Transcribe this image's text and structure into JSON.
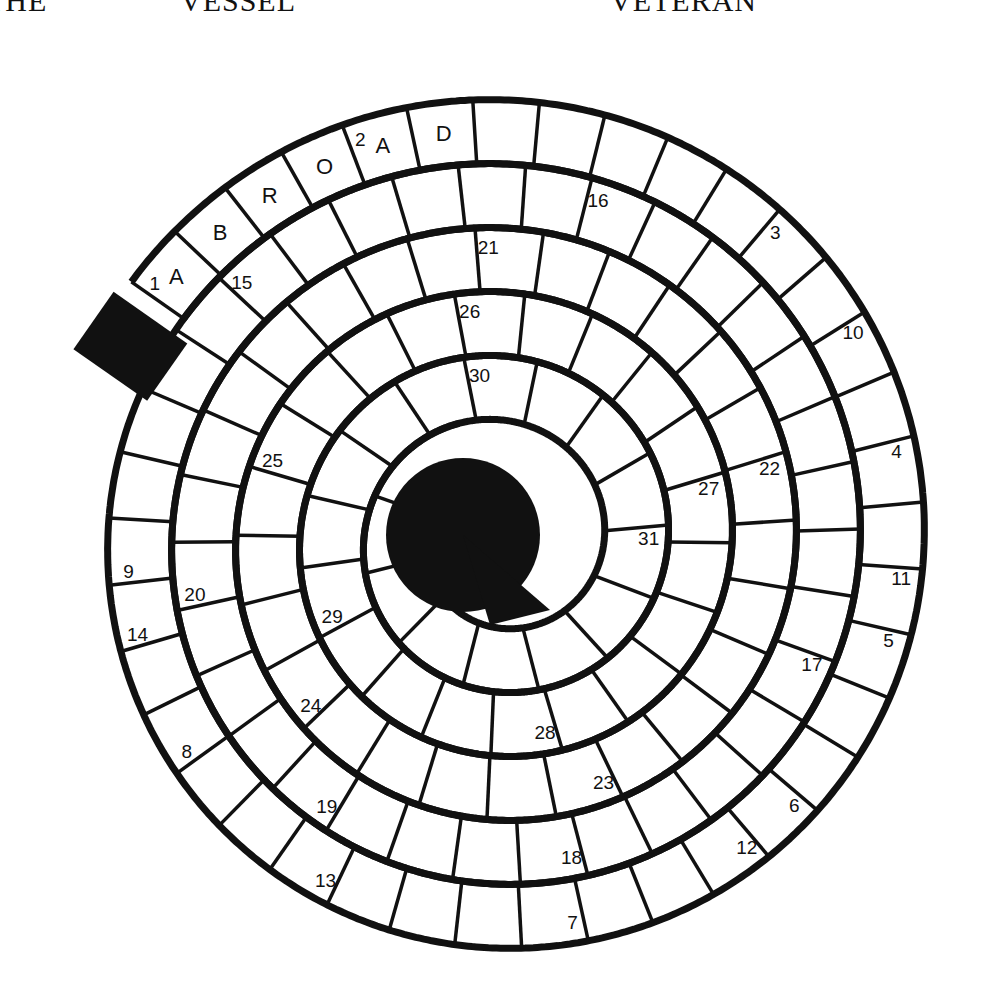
{
  "header_words": [
    "THE",
    "VESSEL",
    "VETERAN"
  ],
  "puzzle": {
    "type": "spiral-crossword",
    "ink_color": "#111111",
    "paper_color": "#ffffff",
    "entered_letters": [
      "A",
      "B",
      "R",
      "O",
      "A",
      "D"
    ],
    "entered_word": "ABROAD",
    "clue_numbers": [
      "1",
      "2",
      "3",
      "4",
      "5",
      "6",
      "7",
      "8",
      "9",
      "10",
      "11",
      "12",
      "13",
      "14",
      "15",
      "16",
      "17",
      "18",
      "19",
      "20",
      "21",
      "22",
      "23",
      "24",
      "25",
      "26",
      "27",
      "28",
      "29",
      "30",
      "31"
    ]
  }
}
